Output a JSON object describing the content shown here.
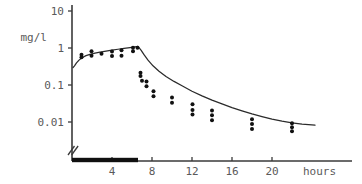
{
  "chart_data": {
    "type": "line",
    "title": "",
    "subtitle": "",
    "xlabel": "hours",
    "ylabel": "mg/l",
    "yscale": "log",
    "xscale": "linear",
    "grid": false,
    "legend": "none",
    "xlim": [
      0,
      24
    ],
    "ylim": [
      0.004,
      10
    ],
    "xticks": [
      4,
      8,
      12,
      16,
      20
    ],
    "xticklabels": [
      "4",
      "8",
      "12",
      "16",
      "20"
    ],
    "yticks": [
      10,
      1,
      0.1,
      0.01
    ],
    "yticklabels": [
      "10",
      "1",
      "0.1",
      "0.01"
    ],
    "axis_break": true,
    "annotations": [
      {
        "name": "infusion-duration-bar",
        "kind": "horizontal-bar-on-x-axis",
        "x_start": 0,
        "x_end": 6.6,
        "description": "thick black bar marking infusion period"
      },
      {
        "name": "axis-break-marker",
        "kind": "double-slash",
        "x": 0,
        "description": "break symbol at origin of x axis"
      }
    ],
    "series": [
      {
        "name": "model-curve",
        "type": "line",
        "points": [
          [
            0.1,
            0.295
          ],
          [
            0.25,
            0.33
          ],
          [
            0.45,
            0.395
          ],
          [
            0.7,
            0.47
          ],
          [
            1.0,
            0.545
          ],
          [
            1.4,
            0.62
          ],
          [
            1.8,
            0.675
          ],
          [
            2.3,
            0.725
          ],
          [
            2.8,
            0.775
          ],
          [
            3.4,
            0.825
          ],
          [
            4.0,
            0.875
          ],
          [
            4.6,
            0.925
          ],
          [
            5.2,
            0.975
          ],
          [
            5.8,
            1.03
          ],
          [
            6.3,
            1.08
          ],
          [
            6.6,
            1.1
          ],
          [
            6.9,
            0.88
          ],
          [
            7.2,
            0.66
          ],
          [
            7.6,
            0.47
          ],
          [
            8.1,
            0.33
          ],
          [
            8.7,
            0.235
          ],
          [
            9.4,
            0.17
          ],
          [
            10.2,
            0.125
          ],
          [
            11.0,
            0.095
          ],
          [
            12.0,
            0.068
          ],
          [
            13.0,
            0.051
          ],
          [
            14.0,
            0.039
          ],
          [
            15.0,
            0.031
          ],
          [
            16.0,
            0.0245
          ],
          [
            17.0,
            0.02
          ],
          [
            18.0,
            0.0165
          ],
          [
            19.0,
            0.014
          ],
          [
            20.0,
            0.012
          ],
          [
            21.0,
            0.0105
          ],
          [
            22.0,
            0.0095
          ],
          [
            23.0,
            0.0088
          ],
          [
            24.3,
            0.0082
          ]
        ]
      },
      {
        "name": "observed-concentrations",
        "type": "scatter",
        "marker": "filled-circle",
        "points": [
          [
            0.95,
            0.56
          ],
          [
            0.95,
            0.66
          ],
          [
            1.95,
            0.62
          ],
          [
            1.95,
            0.82
          ],
          [
            2.95,
            0.7
          ],
          [
            4.0,
            0.61
          ],
          [
            4.0,
            0.8
          ],
          [
            4.95,
            0.62
          ],
          [
            4.95,
            0.87
          ],
          [
            6.1,
            0.82
          ],
          [
            6.1,
            1.02
          ],
          [
            6.55,
            1.02
          ],
          [
            6.85,
            0.175
          ],
          [
            6.85,
            0.215
          ],
          [
            7.0,
            0.13
          ],
          [
            7.45,
            0.125
          ],
          [
            7.45,
            0.092
          ],
          [
            8.15,
            0.068
          ],
          [
            8.15,
            0.05
          ],
          [
            10.0,
            0.046
          ],
          [
            10.0,
            0.033
          ],
          [
            12.05,
            0.03
          ],
          [
            12.05,
            0.021
          ],
          [
            12.05,
            0.016
          ],
          [
            14.0,
            0.0205
          ],
          [
            14.0,
            0.0152
          ],
          [
            14.0,
            0.0112
          ],
          [
            18.0,
            0.0118
          ],
          [
            18.0,
            0.0088
          ],
          [
            18.0,
            0.0065
          ],
          [
            22.0,
            0.0092
          ],
          [
            22.0,
            0.0072
          ],
          [
            22.0,
            0.0056
          ]
        ]
      }
    ]
  },
  "colors": {
    "curve": "#2b2b2b",
    "points": "#111111",
    "axis": "#3a3a3a",
    "tick_label": "#5a5a5a",
    "infusion_bar": "#101010",
    "background": "#ffffff"
  }
}
